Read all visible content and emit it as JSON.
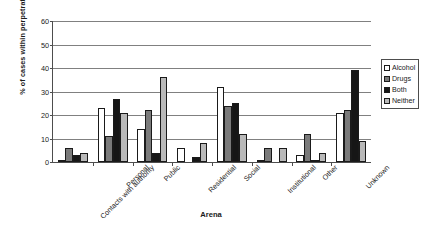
{
  "chart_data": {
    "type": "bar",
    "title": "",
    "xlabel": "Arena",
    "ylabel": "% of cases within perpetrator consumption",
    "ylim": [
      0,
      60
    ],
    "yticks": [
      0,
      10,
      20,
      30,
      40,
      50,
      60
    ],
    "grid": true,
    "legend_position": "right",
    "categories": [
      "Contacts with authority",
      "Personal",
      "Public",
      "Residential",
      "Social",
      "Institutional",
      "Other",
      "Unknown"
    ],
    "series": [
      {
        "name": "Alcohol",
        "color": "#ffffff",
        "values": [
          1,
          23,
          14,
          6,
          32,
          1,
          3,
          21
        ]
      },
      {
        "name": "Drugs",
        "color": "#7a7a7a",
        "values": [
          6,
          11,
          22,
          0,
          24,
          6,
          12,
          22
        ]
      },
      {
        "name": "Both",
        "color": "#161616",
        "values": [
          3,
          27,
          4,
          2,
          25,
          0,
          1,
          39
        ]
      },
      {
        "name": "Neither",
        "color": "#b9b9b9",
        "values": [
          4,
          21,
          36,
          8,
          12,
          6,
          4,
          9
        ]
      }
    ]
  }
}
